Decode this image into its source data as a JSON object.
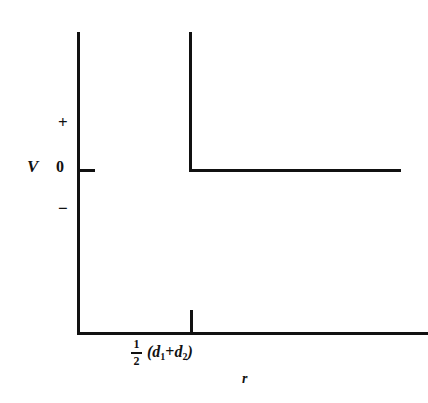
{
  "figure": {
    "title": "",
    "background_color": "#ffffff",
    "line_color": "#111111"
  },
  "axes": {
    "y_axis": {
      "name": "V",
      "label": "V",
      "tick_labels": [
        "+",
        "0",
        "−"
      ],
      "zero_label": "0",
      "plus_label": "+",
      "minus_label": "−"
    },
    "x_axis": {
      "name": "r",
      "label": "r",
      "tick_label_parts": {
        "fraction_numerator": "1",
        "fraction_denominator": "2",
        "open_paren": "(",
        "term_one_symbol": "d",
        "term_one_subscript": "1",
        "operator": "+",
        "term_two_symbol": "d",
        "term_two_subscript": "2",
        "close_paren": ")"
      }
    }
  },
  "chart_data": {
    "type": "line",
    "title": "",
    "xlabel": "r",
    "ylabel": "V",
    "grid": false,
    "legend": null,
    "xlim": [
      0,
      1
    ],
    "ylim": [
      -1,
      1
    ],
    "ytick_labels": [
      "+",
      "0",
      "−"
    ],
    "ytick_values": [
      0.55,
      0,
      -0.45
    ],
    "xtick_labels": [
      "½ (d₁ + d₂)"
    ],
    "xtick_values": [
      0.32
    ],
    "annotations": [],
    "series": [
      {
        "name": "hard-sphere potential",
        "description": "Infinite repulsive wall at r = ½(d₁+d₂); V = 0 for larger r",
        "x": [
          0.32,
          0.32,
          1.0
        ],
        "y": [
          1.0,
          0.0,
          0.0
        ]
      }
    ]
  }
}
